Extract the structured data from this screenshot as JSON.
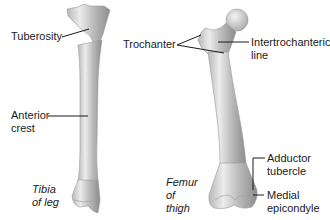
{
  "diagram": {
    "colors": {
      "background": "#ffffff",
      "bone_light": "#e8e8e8",
      "bone_mid": "#c4c4c4",
      "bone_dark": "#8a8a8a",
      "leader_line": "#1a1a1a",
      "text": "#1a1a1a"
    },
    "bones": [
      {
        "id": "tibia",
        "caption_line1": "Tibia",
        "caption_line2": "of leg",
        "labels": [
          {
            "text": "Tuberosity"
          },
          {
            "text_line1": "Anterior",
            "text_line2": "crest"
          }
        ]
      },
      {
        "id": "femur",
        "caption_line1": "Femur",
        "caption_line2": "of",
        "caption_line3": "thigh",
        "labels": [
          {
            "text": "Trochanter"
          },
          {
            "text_line1": "Intertrochanteric",
            "text_line2": "line"
          },
          {
            "text_line1": "Adductor",
            "text_line2": "tubercle"
          },
          {
            "text_line1": "Medial",
            "text_line2": "epicondyle"
          }
        ]
      }
    ]
  }
}
